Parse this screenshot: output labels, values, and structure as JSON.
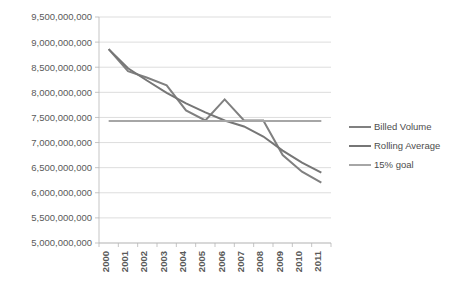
{
  "chart_data": {
    "type": "line",
    "title": "",
    "subtitle": "",
    "xlabel": "",
    "ylabel": "",
    "categories": [
      "2000",
      "2001",
      "2002",
      "2003",
      "2004",
      "2005",
      "2006",
      "2007",
      "2008",
      "2009",
      "2010",
      "2011"
    ],
    "x": [
      2000,
      2001,
      2002,
      2003,
      2004,
      2005,
      2006,
      2007,
      2008,
      2009,
      2010,
      2011
    ],
    "ylim": [
      5000000000,
      9500000000
    ],
    "ytick_values": [
      5000000000,
      5500000000,
      6000000000,
      6500000000,
      7000000000,
      7500000000,
      8000000000,
      8500000000,
      9000000000,
      9500000000
    ],
    "ytick_labels": [
      "5,000,000,000",
      "5,500,000,000",
      "6,000,000,000",
      "6,500,000,000",
      "7,000,000,000",
      "7,500,000,000",
      "8,000,000,000",
      "8,500,000,000",
      "9,000,000,000",
      "9,500,000,000"
    ],
    "grid": true,
    "grid_axis": "y",
    "legend_position": "right",
    "series": [
      {
        "name": "Billed Volume",
        "color": "#808080",
        "width": 2.0,
        "values": [
          8860000000,
          8420000000,
          8290000000,
          8140000000,
          7640000000,
          7440000000,
          7860000000,
          7440000000,
          7440000000,
          6750000000,
          6420000000,
          6200000000
        ]
      },
      {
        "name": "Rolling Average",
        "color": "#767676",
        "width": 2.0,
        "values": [
          8860000000,
          8480000000,
          8230000000,
          7990000000,
          7780000000,
          7600000000,
          7440000000,
          7320000000,
          7120000000,
          6840000000,
          6600000000,
          6400000000
        ]
      },
      {
        "name": "15% goal",
        "color": "#a6a6a6",
        "width": 2.0,
        "values": [
          7430000000,
          7430000000,
          7430000000,
          7430000000,
          7430000000,
          7430000000,
          7430000000,
          7430000000,
          7430000000,
          7430000000,
          7430000000,
          7430000000
        ]
      }
    ]
  },
  "legend": {
    "entries": [
      {
        "label": "Billed Volume"
      },
      {
        "label": "Rolling Average"
      },
      {
        "label": "15% goal"
      }
    ]
  }
}
